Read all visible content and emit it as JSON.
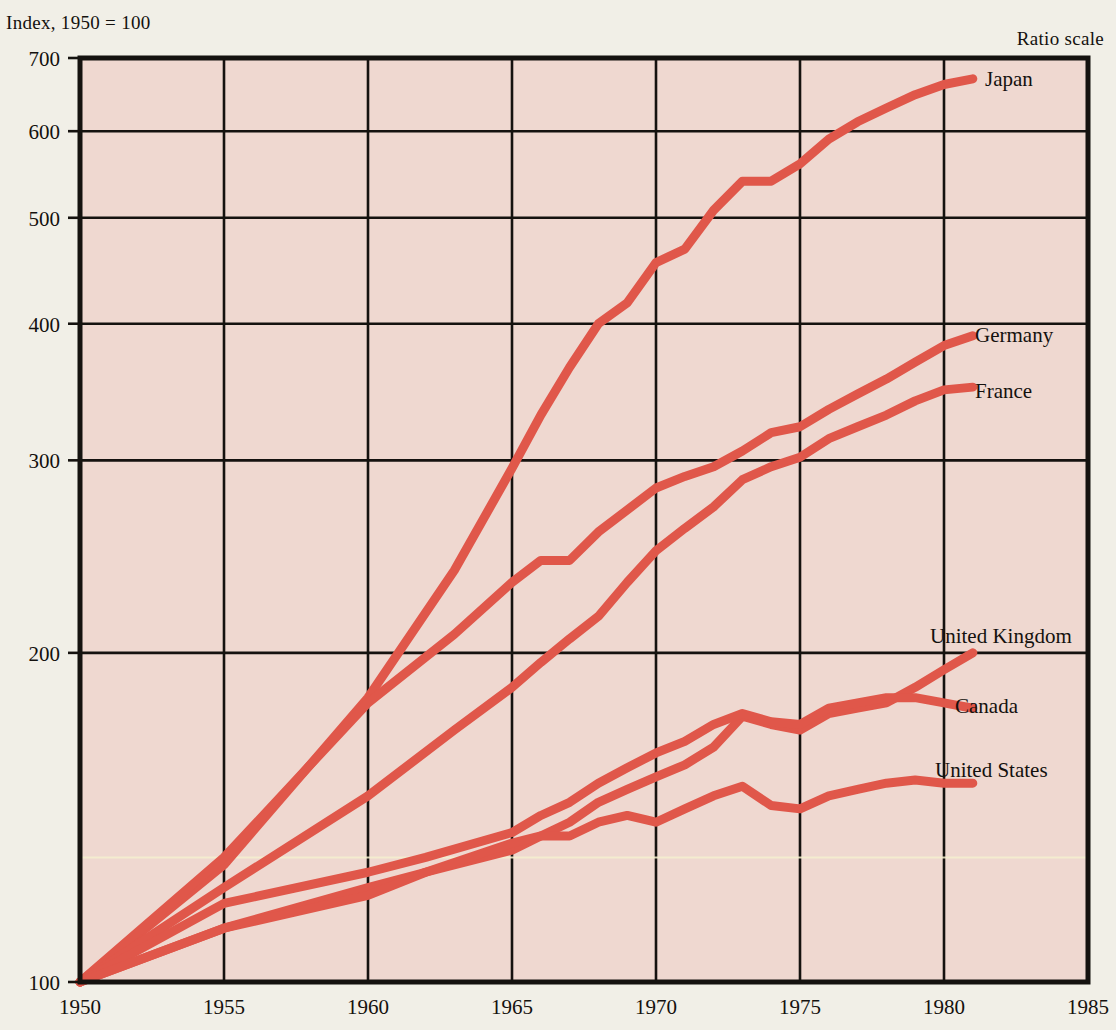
{
  "header": {
    "index_note": "Index, 1950 = 100",
    "ratio_note": "Ratio scale"
  },
  "chart_data": {
    "type": "line",
    "title": "",
    "subtitle": "",
    "xlabel": "",
    "ylabel": "Index, 1950 = 100",
    "scale": "log",
    "yscale_note": "Ratio scale",
    "grid": true,
    "legend_position": "right-inline-labels",
    "xlim": [
      1950,
      1985
    ],
    "ylim": [
      100,
      700
    ],
    "xticks": [
      1950,
      1955,
      1960,
      1965,
      1970,
      1975,
      1980,
      1985
    ],
    "xticklabels": [
      "1950",
      "1955",
      "1960",
      "1965",
      "1970",
      "1975",
      "1980",
      "1985"
    ],
    "yticks": [
      100,
      200,
      300,
      400,
      500,
      600,
      700
    ],
    "yticklabels": [
      "100",
      "200",
      "300",
      "400",
      "500",
      "600",
      "700"
    ],
    "line_color": "#e0574a",
    "plot_background": "#efd8d0",
    "axis_color": "#15120f",
    "series": [
      {
        "name": "Japan",
        "label": "Japan",
        "x": [
          1950,
          1955,
          1960,
          1963,
          1965,
          1966,
          1967,
          1968,
          1969,
          1970,
          1971,
          1972,
          1973,
          1974,
          1975,
          1976,
          1977,
          1978,
          1979,
          1980,
          1981
        ],
        "values": [
          100,
          128,
          182,
          238,
          295,
          330,
          365,
          400,
          418,
          455,
          468,
          508,
          540,
          540,
          560,
          590,
          612,
          630,
          648,
          662,
          670
        ]
      },
      {
        "name": "Germany",
        "label": "Germany",
        "x": [
          1950,
          1955,
          1960,
          1963,
          1965,
          1966,
          1967,
          1968,
          1970,
          1971,
          1972,
          1973,
          1974,
          1975,
          1976,
          1977,
          1978,
          1979,
          1980,
          1981
        ],
        "values": [
          100,
          130,
          180,
          208,
          232,
          243,
          243,
          258,
          283,
          290,
          296,
          306,
          318,
          322,
          334,
          345,
          356,
          369,
          382,
          390
        ]
      },
      {
        "name": "France",
        "label": "France",
        "x": [
          1950,
          1955,
          1960,
          1963,
          1965,
          1966,
          1967,
          1968,
          1969,
          1970,
          1971,
          1972,
          1973,
          1974,
          1975,
          1976,
          1977,
          1978,
          1979,
          1980,
          1981
        ],
        "values": [
          100,
          122,
          148,
          170,
          186,
          196,
          206,
          216,
          232,
          248,
          260,
          272,
          288,
          296,
          302,
          314,
          322,
          330,
          340,
          348,
          350
        ]
      },
      {
        "name": "United Kingdom",
        "label": "United Kingdom",
        "x": [
          1950,
          1955,
          1960,
          1962,
          1965,
          1966,
          1967,
          1968,
          1969,
          1970,
          1971,
          1972,
          1973,
          1974,
          1975,
          1976,
          1977,
          1978,
          1979,
          1980,
          1981
        ],
        "values": [
          100,
          112,
          122,
          126,
          132,
          136,
          140,
          146,
          150,
          154,
          158,
          164,
          175,
          172,
          170,
          176,
          178,
          180,
          186,
          193,
          200
        ]
      },
      {
        "name": "Canada",
        "label": "Canada",
        "x": [
          1950,
          1955,
          1960,
          1962,
          1965,
          1966,
          1967,
          1968,
          1969,
          1970,
          1971,
          1972,
          1973,
          1974,
          1975,
          1976,
          1977,
          1978,
          1979,
          1980,
          1981
        ],
        "values": [
          100,
          118,
          126,
          130,
          137,
          142,
          146,
          152,
          157,
          162,
          166,
          172,
          176,
          173,
          172,
          178,
          180,
          182,
          182,
          180,
          178
        ]
      },
      {
        "name": "United States",
        "label": "United States",
        "x": [
          1950,
          1955,
          1960,
          1962,
          1965,
          1966,
          1967,
          1968,
          1969,
          1970,
          1971,
          1972,
          1973,
          1974,
          1975,
          1976,
          1977,
          1978,
          1979,
          1980,
          1981
        ],
        "values": [
          100,
          112,
          120,
          126,
          134,
          136,
          136,
          140,
          142,
          140,
          144,
          148,
          151,
          145,
          144,
          148,
          150,
          152,
          153,
          152,
          152
        ]
      }
    ],
    "series_label_positions": [
      {
        "name": "Japan",
        "x": 985,
        "y": 86
      },
      {
        "name": "Germany",
        "x": 975,
        "y": 342
      },
      {
        "name": "France",
        "x": 975,
        "y": 398
      },
      {
        "name": "United Kingdom",
        "x": 930,
        "y": 643
      },
      {
        "name": "Canada",
        "x": 955,
        "y": 713
      },
      {
        "name": "United States",
        "x": 935,
        "y": 777
      }
    ]
  }
}
